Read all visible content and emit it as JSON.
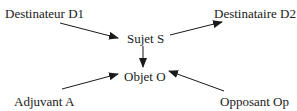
{
  "diagram": {
    "type": "actantial-model",
    "nodes": {
      "destinateur": {
        "label": "Destinateur D1"
      },
      "destinataire": {
        "label": "Destinataire D2"
      },
      "sujet": {
        "label": "Sujet S"
      },
      "objet": {
        "label": "Objet O"
      },
      "adjuvant": {
        "label": "Adjuvant A"
      },
      "opposant": {
        "label": "Opposant Op"
      }
    },
    "edges": [
      {
        "from": "Destinateur D1",
        "to": "Sujet S"
      },
      {
        "from": "Sujet S",
        "to": "Destinataire D2"
      },
      {
        "from": "Sujet S",
        "to": "Objet O"
      },
      {
        "from": "Adjuvant A",
        "to": "Objet O"
      },
      {
        "from": "Opposant Op",
        "to": "Objet O"
      }
    ],
    "colors": {
      "text": "#1a1a1a",
      "arrow": "#1a1a1a",
      "background": "#ffffff"
    }
  }
}
